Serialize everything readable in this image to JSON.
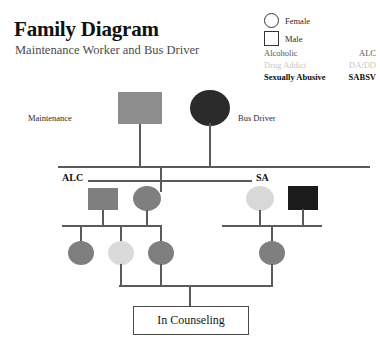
{
  "header": {
    "title": "Family Diagram",
    "subtitle": "Maintenance Worker and Bus Driver"
  },
  "legend": {
    "shapes": [
      {
        "icon": "female-circle-icon",
        "label": "Female",
        "shape": "circle"
      },
      {
        "icon": "male-square-icon",
        "label": "Male",
        "shape": "square"
      }
    ],
    "codes": [
      {
        "name": "Alcoholic",
        "code": "ALC",
        "style": "normal"
      },
      {
        "name": "Drug Addict",
        "code": "DA/DD",
        "style": "faded"
      },
      {
        "name": "Sexually Abusive",
        "code": "SABSV",
        "style": "bold"
      }
    ]
  },
  "genogram": {
    "generation1": {
      "father": {
        "role": "Maintenance",
        "shape": "square",
        "fill": "#8d8d8d"
      },
      "mother": {
        "role": "Bus Driver",
        "shape": "circle",
        "fill": "#2b2b2b"
      },
      "relationship_labels": {
        "left": "ALC",
        "right": "SA"
      }
    },
    "generation2": {
      "left_couple": [
        {
          "shape": "square",
          "fill": "#7f7f7f"
        },
        {
          "shape": "circle",
          "fill": "#7f7f7f"
        }
      ],
      "right_couple": [
        {
          "shape": "circle",
          "fill": "#d8d8d8"
        },
        {
          "shape": "square",
          "fill": "#1b1b1b"
        }
      ]
    },
    "generation3": {
      "left_children": [
        {
          "shape": "circle",
          "fill": "#7f7f7f"
        },
        {
          "shape": "circle",
          "fill": "#dadada"
        },
        {
          "shape": "circle",
          "fill": "#7f7f7f"
        }
      ],
      "right_children": [
        {
          "shape": "circle",
          "fill": "#7f7f7f"
        }
      ]
    },
    "outcome": {
      "label": "In Counseling"
    }
  },
  "colors": {
    "line": "#5a5a5a",
    "text": "#1a1a1a",
    "faded_text": "#c8c8c8",
    "background": "#ffffff"
  }
}
